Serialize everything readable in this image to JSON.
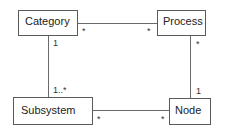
{
  "diagram": {
    "type": "UML class diagram",
    "classes": [
      {
        "id": "category",
        "label": "Category"
      },
      {
        "id": "process",
        "label": "Process"
      },
      {
        "id": "subsystem",
        "label": "Subsystem"
      },
      {
        "id": "node",
        "label": "Node"
      }
    ],
    "associations": [
      {
        "from": "category",
        "to": "process",
        "from_mult": "*",
        "to_mult": "*"
      },
      {
        "from": "category",
        "to": "subsystem",
        "from_mult": "1",
        "to_mult": "1..*"
      },
      {
        "from": "process",
        "to": "node",
        "from_mult": "*",
        "to_mult": "1"
      },
      {
        "from": "subsystem",
        "to": "node",
        "from_mult": "*",
        "to_mult": "*"
      }
    ]
  }
}
